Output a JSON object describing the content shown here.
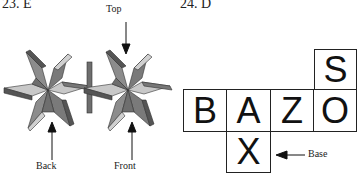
{
  "problems": [
    {
      "heading": "23. E",
      "labels": {
        "top": "Top",
        "back": "Back",
        "front": "Front"
      },
      "colors": {
        "dark": "#6e6e6e",
        "mid": "#8c8c8c",
        "light": "#c8c8c8",
        "edge": "#333333"
      }
    },
    {
      "heading": "24. D",
      "net": [
        {
          "letter": "S",
          "position": "top-right"
        },
        {
          "letter": "B",
          "position": "row-1"
        },
        {
          "letter": "A",
          "position": "row-2"
        },
        {
          "letter": "Z",
          "position": "row-3"
        },
        {
          "letter": "O",
          "position": "row-4"
        },
        {
          "letter": "X",
          "position": "below-A"
        }
      ],
      "labels": {
        "base": "Base"
      }
    }
  ]
}
